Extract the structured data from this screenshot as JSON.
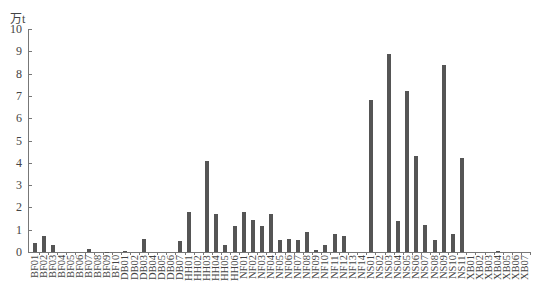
{
  "chart_data": {
    "type": "bar",
    "title": "",
    "xlabel": "",
    "ylabel": "万t",
    "ylim": [
      0,
      10
    ],
    "yticks": [
      0,
      1,
      2,
      3,
      4,
      5,
      6,
      7,
      8,
      9,
      10
    ],
    "grid": false,
    "legend": null,
    "bar_color": "#555555",
    "categories": [
      "BF01",
      "BF02",
      "BF03",
      "BF04",
      "BF05",
      "BF06",
      "BF07",
      "BF08",
      "BF09",
      "BF10",
      "DB01",
      "DB02",
      "DB03",
      "DB04",
      "DB05",
      "DB06",
      "DB07",
      "HH01",
      "HH02",
      "HH03",
      "HH04",
      "HH05",
      "HH06",
      "NF01",
      "NF02",
      "NF03",
      "NF04",
      "NF05",
      "NF06",
      "NF07",
      "NF08",
      "NF09",
      "NF10",
      "NF11",
      "NF12",
      "NF13",
      "NF14",
      "NS01",
      "NS02",
      "NS03",
      "NS04",
      "NS05",
      "NS06",
      "NS07",
      "NS08",
      "NS09",
      "NS10",
      "NS11",
      "XB01",
      "XB02",
      "XB03",
      "XB04",
      "XB05",
      "XB06",
      "XB07"
    ],
    "values": [
      0.4,
      0.7,
      0.3,
      0,
      0,
      0,
      0.15,
      0,
      0.02,
      0,
      0.05,
      0,
      0.6,
      0,
      0,
      0,
      0.5,
      1.8,
      0,
      4.1,
      1.7,
      0.3,
      1.15,
      1.8,
      1.45,
      1.15,
      1.7,
      0.55,
      0.6,
      0.55,
      0.9,
      0.1,
      0.3,
      0.8,
      0.7,
      0,
      0,
      6.8,
      0,
      8.9,
      1.4,
      7.2,
      4.3,
      1.2,
      0.55,
      8.4,
      0.8,
      4.2,
      0,
      0,
      0,
      0.03,
      0,
      0,
      0
    ]
  }
}
